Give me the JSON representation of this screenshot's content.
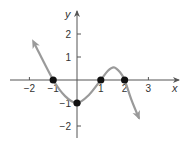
{
  "chart_data": {
    "type": "line",
    "title": "",
    "xlabel": "x",
    "ylabel": "y",
    "xlim": [
      -2.5,
      3.5
    ],
    "ylim": [
      -2.5,
      2.8
    ],
    "grid": false,
    "legend": null,
    "x_ticks": [
      -2,
      -1,
      1,
      2,
      3
    ],
    "x_tick_labels": [
      "−2",
      "−1",
      "1",
      "2",
      "3"
    ],
    "y_ticks": [
      2,
      1,
      -1,
      -2
    ],
    "y_tick_labels": [
      "2",
      "1",
      "−1",
      "−2"
    ],
    "series": [
      {
        "name": "f(x)",
        "description": "cubic-like curve with arrows at both ends; roots at x=-1, 1, 2; y-intercept -1; local min near (0,-1); local max near (1.55, 0.55)",
        "x": [
          -1.75,
          -1.0,
          -0.5,
          0.0,
          0.5,
          1.0,
          1.3,
          1.55,
          1.8,
          2.0,
          2.3,
          2.6
        ],
        "y": [
          1.5,
          0.0,
          -0.7,
          -1.0,
          -0.65,
          0.0,
          0.4,
          0.55,
          0.35,
          0.0,
          -0.9,
          -1.65
        ],
        "arrows": [
          "start",
          "end"
        ]
      }
    ],
    "highlighted_points": [
      {
        "x": -1,
        "y": 0
      },
      {
        "x": 0,
        "y": -1
      },
      {
        "x": 1,
        "y": 0
      },
      {
        "x": 2,
        "y": 0
      }
    ]
  },
  "colors": {
    "axis": "#555555",
    "curve": "#9a9a9a",
    "points": "#111111",
    "text": "#333333"
  }
}
